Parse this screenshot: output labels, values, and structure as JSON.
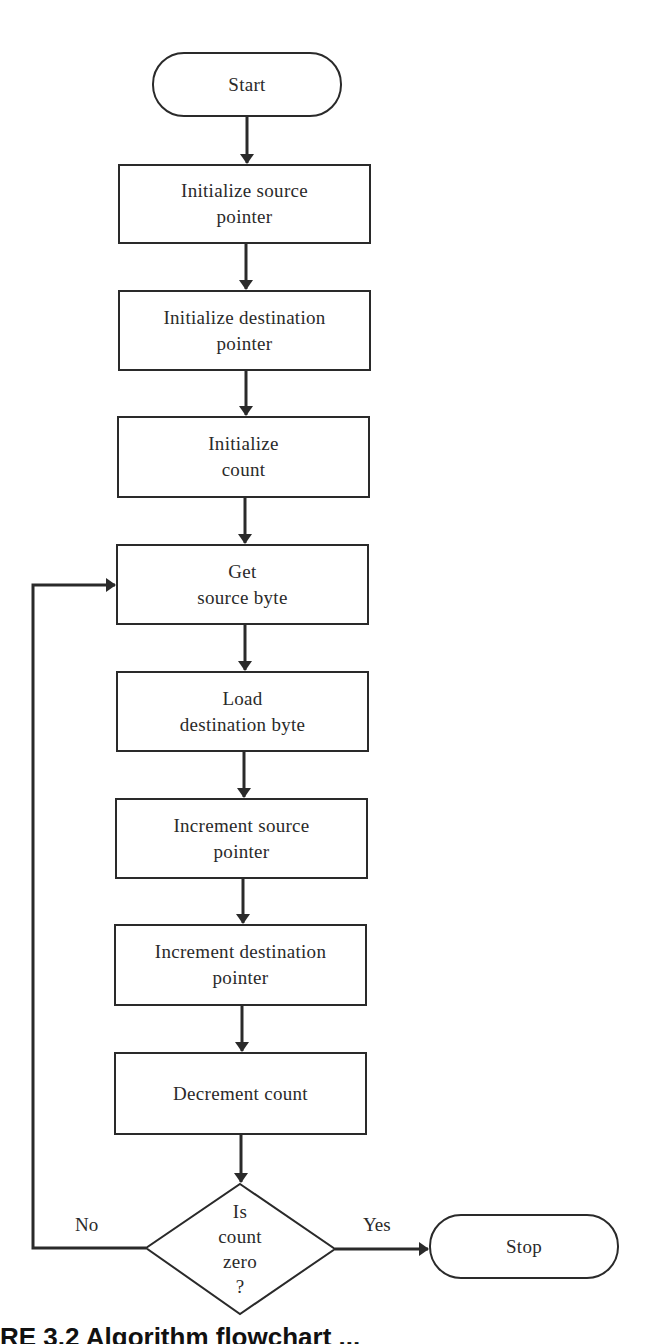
{
  "diagram": {
    "type": "flowchart",
    "nodes": [
      {
        "id": "start",
        "shape": "terminal",
        "label": "Start"
      },
      {
        "id": "init_src",
        "shape": "process",
        "lines": [
          "Initialize source",
          "pointer"
        ]
      },
      {
        "id": "init_dst",
        "shape": "process",
        "lines": [
          "Initialize destination",
          "pointer"
        ]
      },
      {
        "id": "init_count",
        "shape": "process",
        "lines": [
          "Initialize",
          "count"
        ]
      },
      {
        "id": "get_byte",
        "shape": "process",
        "lines": [
          "Get",
          "source byte"
        ]
      },
      {
        "id": "load_byte",
        "shape": "process",
        "lines": [
          "Load",
          "destination byte"
        ]
      },
      {
        "id": "inc_src",
        "shape": "process",
        "lines": [
          "Increment source",
          "pointer"
        ]
      },
      {
        "id": "inc_dst",
        "shape": "process",
        "lines": [
          "Increment destination",
          "pointer"
        ]
      },
      {
        "id": "dec_count",
        "shape": "process",
        "lines": [
          "Decrement count"
        ]
      },
      {
        "id": "decision",
        "shape": "decision",
        "lines": [
          "Is",
          "count",
          "zero",
          "?"
        ]
      },
      {
        "id": "stop",
        "shape": "terminal",
        "label": "Stop"
      }
    ],
    "edges": [
      {
        "from": "start",
        "to": "init_src"
      },
      {
        "from": "init_src",
        "to": "init_dst"
      },
      {
        "from": "init_dst",
        "to": "init_count"
      },
      {
        "from": "init_count",
        "to": "get_byte"
      },
      {
        "from": "get_byte",
        "to": "load_byte"
      },
      {
        "from": "load_byte",
        "to": "inc_src"
      },
      {
        "from": "inc_src",
        "to": "inc_dst"
      },
      {
        "from": "inc_dst",
        "to": "dec_count"
      },
      {
        "from": "dec_count",
        "to": "decision"
      },
      {
        "from": "decision",
        "to": "stop",
        "label": "Yes"
      },
      {
        "from": "decision",
        "to": "get_byte",
        "label": "No"
      }
    ],
    "branch_labels": {
      "no": "No",
      "yes": "Yes"
    }
  },
  "caption": "RE 3.2  Algorithm flowchart ...",
  "colors": {
    "stroke": "#2a2a2a",
    "background": "#ffffff"
  }
}
